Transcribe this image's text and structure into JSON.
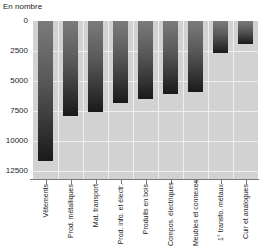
{
  "chart_data": {
    "type": "bar",
    "title": "",
    "ylabel": "En nombre",
    "xlabel": "",
    "categories": [
      "Vêtements",
      "Prod. métalliques",
      "Mat. transport",
      "Prod. info. et électr.",
      "Produits en bois",
      "Compos. électriques",
      "Meubles et connexes",
      "1° transfo. métaux",
      "Cuir et analogues"
    ],
    "values": [
      11700,
      7900,
      7600,
      6800,
      6500,
      6100,
      5900,
      2700,
      1900
    ],
    "yticks": [
      0,
      2500,
      5000,
      7500,
      10000,
      12500
    ],
    "ylim": [
      0,
      12500
    ],
    "y_axis_inverted": true,
    "grid": true,
    "legend": "none",
    "bar_style": "vertical-gradient"
  },
  "colors": {
    "plot_bg": "#d2d2d2",
    "grid": "#efefef",
    "bar_top": "#7b7b7b",
    "bar_bottom": "#1a1a1a",
    "axis": "#7a7a7a",
    "text": "#1c1c1c",
    "page_bg": "#ffffff"
  }
}
